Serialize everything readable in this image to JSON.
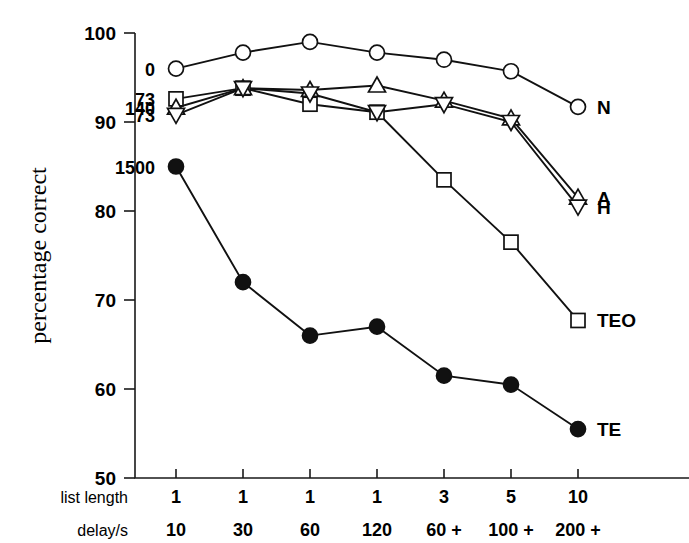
{
  "chart_data": {
    "type": "line",
    "title": "",
    "xlabel": "",
    "ylabel": "percentage correct",
    "ylim": [
      50,
      100
    ],
    "yticks": [
      50,
      60,
      70,
      80,
      90,
      100
    ],
    "grid": false,
    "legend_position": "right-of-plot-at-line-ends",
    "x_axis_rows": [
      {
        "label": "list length",
        "values": [
          "1",
          "1",
          "1",
          "1",
          "3",
          "5",
          "10"
        ]
      },
      {
        "label": "delay/s",
        "values": [
          "10",
          "30",
          "60",
          "120",
          "60 +",
          "100 +",
          "200 +"
        ]
      }
    ],
    "x_positions": [
      1,
      2,
      3,
      4,
      5,
      6,
      7
    ],
    "series": [
      {
        "name": "N",
        "label": "N",
        "marker": "open-circle",
        "annotation": "0",
        "values": [
          96.0,
          97.8,
          99.0,
          97.8,
          97.0,
          95.7,
          91.7
        ]
      },
      {
        "name": "TEO",
        "label": "TEO",
        "marker": "open-square",
        "annotation": "73",
        "values": [
          92.6,
          93.8,
          92.0,
          91.1,
          83.5,
          76.5,
          67.7
        ]
      },
      {
        "name": "A",
        "label": "A",
        "marker": "open-triangle-up",
        "annotation": "140",
        "values": [
          91.6,
          93.8,
          93.6,
          94.1,
          92.4,
          90.4,
          81.5
        ]
      },
      {
        "name": "H",
        "label": "H",
        "marker": "open-triangle-down",
        "annotation": "73",
        "values": [
          90.8,
          93.8,
          93.2,
          91.1,
          92.0,
          90.0,
          80.5
        ]
      },
      {
        "name": "TE",
        "label": "TE",
        "marker": "filled-circle",
        "annotation": "1500",
        "values": [
          85.0,
          72.0,
          66.0,
          67.0,
          61.5,
          60.5,
          55.5
        ]
      }
    ]
  }
}
